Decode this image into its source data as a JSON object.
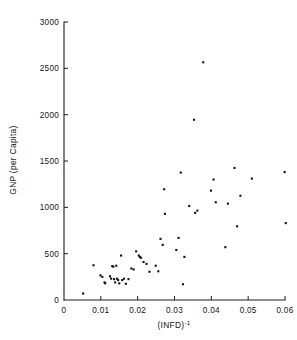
{
  "chart_data": {
    "type": "scatter",
    "title": "",
    "subtitle": "",
    "xlabel": "(INFD)-1",
    "xlabel_base": "(INFD)",
    "xlabel_exponent": "-1",
    "ylabel": "GNP (per Capita)",
    "xlim": [
      0,
      0.062
    ],
    "ylim": [
      0,
      3000
    ],
    "grid": false,
    "legend": null,
    "xticks": [
      0,
      0.01,
      0.02,
      0.03,
      0.04,
      0.05,
      0.06
    ],
    "xticklabels": [
      "0",
      "0.01",
      "0.02",
      "0.03",
      "0.04",
      "0.05",
      "0.06"
    ],
    "yticks": [
      0,
      500,
      1000,
      1500,
      2000,
      2500,
      3000
    ],
    "yticklabels": [
      "0",
      "500",
      "1000",
      "1500",
      "2000",
      "2500",
      "3000"
    ],
    "marker": "square",
    "marker_color": "#111111",
    "marker_size": 2.1,
    "n_points": 57,
    "points": [
      {
        "x": 0.0052,
        "y": 70
      },
      {
        "x": 0.008,
        "y": 375
      },
      {
        "x": 0.0099,
        "y": 265
      },
      {
        "x": 0.0104,
        "y": 250
      },
      {
        "x": 0.011,
        "y": 190
      },
      {
        "x": 0.0112,
        "y": 180
      },
      {
        "x": 0.0125,
        "y": 255
      },
      {
        "x": 0.0128,
        "y": 230
      },
      {
        "x": 0.0131,
        "y": 365
      },
      {
        "x": 0.0134,
        "y": 360
      },
      {
        "x": 0.0136,
        "y": 225
      },
      {
        "x": 0.0139,
        "y": 190
      },
      {
        "x": 0.0142,
        "y": 370
      },
      {
        "x": 0.0144,
        "y": 230
      },
      {
        "x": 0.0147,
        "y": 215
      },
      {
        "x": 0.015,
        "y": 180
      },
      {
        "x": 0.0155,
        "y": 480
      },
      {
        "x": 0.0158,
        "y": 215
      },
      {
        "x": 0.0163,
        "y": 230
      },
      {
        "x": 0.0168,
        "y": 175
      },
      {
        "x": 0.0175,
        "y": 225
      },
      {
        "x": 0.0183,
        "y": 340
      },
      {
        "x": 0.0189,
        "y": 330
      },
      {
        "x": 0.0196,
        "y": 525
      },
      {
        "x": 0.0203,
        "y": 480
      },
      {
        "x": 0.0206,
        "y": 465
      },
      {
        "x": 0.0209,
        "y": 455
      },
      {
        "x": 0.0216,
        "y": 410
      },
      {
        "x": 0.0224,
        "y": 390
      },
      {
        "x": 0.0232,
        "y": 305
      },
      {
        "x": 0.0249,
        "y": 370
      },
      {
        "x": 0.0256,
        "y": 310
      },
      {
        "x": 0.0262,
        "y": 660
      },
      {
        "x": 0.0268,
        "y": 595
      },
      {
        "x": 0.0272,
        "y": 1195
      },
      {
        "x": 0.0274,
        "y": 930
      },
      {
        "x": 0.0305,
        "y": 540
      },
      {
        "x": 0.0311,
        "y": 670
      },
      {
        "x": 0.0317,
        "y": 1375
      },
      {
        "x": 0.0323,
        "y": 170
      },
      {
        "x": 0.0327,
        "y": 465
      },
      {
        "x": 0.034,
        "y": 1015
      },
      {
        "x": 0.0353,
        "y": 1945
      },
      {
        "x": 0.0356,
        "y": 940
      },
      {
        "x": 0.0362,
        "y": 965
      },
      {
        "x": 0.0378,
        "y": 2565
      },
      {
        "x": 0.0399,
        "y": 1180
      },
      {
        "x": 0.0406,
        "y": 1300
      },
      {
        "x": 0.0412,
        "y": 1055
      },
      {
        "x": 0.0438,
        "y": 570
      },
      {
        "x": 0.0445,
        "y": 1040
      },
      {
        "x": 0.0463,
        "y": 1425
      },
      {
        "x": 0.047,
        "y": 795
      },
      {
        "x": 0.0479,
        "y": 1125
      },
      {
        "x": 0.051,
        "y": 1310
      },
      {
        "x": 0.0599,
        "y": 1380
      },
      {
        "x": 0.0602,
        "y": 830
      }
    ]
  },
  "geometry": {
    "x_px_at_xmin": 64,
    "x_px_at_xmax": 285,
    "x_value_min": 0,
    "x_value_max": 0.06,
    "y_px_at_ymin": 300,
    "y_px_at_ymax": 22,
    "y_value_min": 0,
    "y_value_max": 3000,
    "tick_len": 4
  }
}
